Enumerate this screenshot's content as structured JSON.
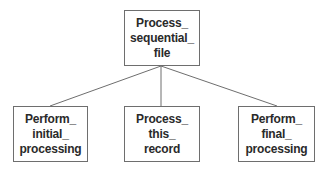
{
  "diagram": {
    "type": "hierarchy-chart",
    "root": {
      "id": "process-sequential-file",
      "lines": [
        "Process_",
        "sequential_",
        "file"
      ]
    },
    "children": [
      {
        "id": "perform-initial-processing",
        "lines": [
          "Perform_",
          "initial_",
          "processing"
        ]
      },
      {
        "id": "process-this-record",
        "lines": [
          "Process_",
          "this_",
          "record"
        ]
      },
      {
        "id": "perform-final-processing",
        "lines": [
          "Perform_",
          "final_",
          "processing"
        ]
      }
    ],
    "edges": [
      {
        "from": "process-sequential-file",
        "to": "perform-initial-processing"
      },
      {
        "from": "process-sequential-file",
        "to": "process-this-record"
      },
      {
        "from": "process-sequential-file",
        "to": "perform-final-processing"
      }
    ],
    "colors": {
      "line": "#6e6e6e",
      "text": "#2a2a2a",
      "background": "#ffffff"
    }
  }
}
